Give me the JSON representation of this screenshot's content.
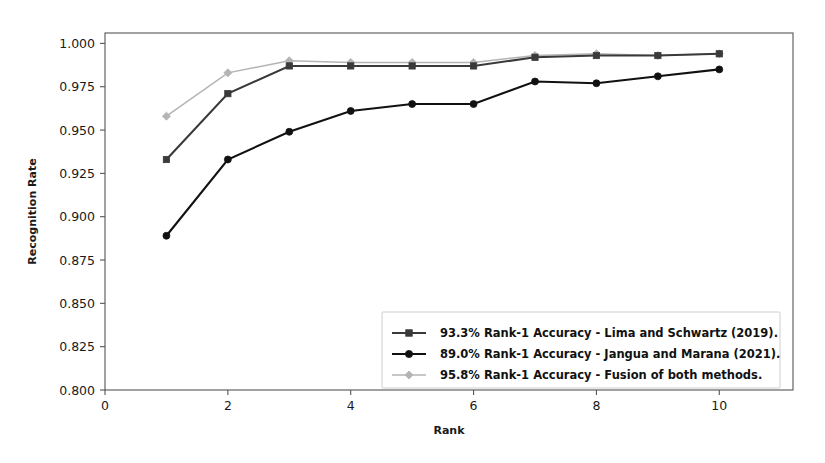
{
  "chart_data": {
    "type": "line",
    "title": "",
    "xlabel": "Rank",
    "ylabel": "Recognition Rate",
    "xlim": [
      0,
      11.2
    ],
    "ylim": [
      0.8,
      1.006
    ],
    "xticks": [
      0,
      2,
      4,
      6,
      8,
      10
    ],
    "xticklabels": [
      "0",
      "2",
      "4",
      "6",
      "8",
      "10"
    ],
    "yticks": [
      0.8,
      0.825,
      0.85,
      0.875,
      0.9,
      0.925,
      0.95,
      0.975,
      1.0
    ],
    "yticklabels": [
      "0.800",
      "0.825",
      "0.850",
      "0.875",
      "0.900",
      "0.925",
      "0.950",
      "0.975",
      "1.000"
    ],
    "grid": false,
    "legend_position": "lower right",
    "x": [
      1,
      2,
      3,
      4,
      5,
      6,
      7,
      8,
      9,
      10
    ],
    "series": [
      {
        "name": "93.3% Rank-1 Accuracy - Lima and Schwartz (2019).",
        "marker": "square",
        "color": "#3a3a3a",
        "values": [
          0.933,
          0.971,
          0.987,
          0.987,
          0.987,
          0.987,
          0.992,
          0.993,
          0.993,
          0.994
        ]
      },
      {
        "name": "89.0% Rank-1 Accuracy - Jangua and Marana (2021).",
        "marker": "circle",
        "color": "#111111",
        "values": [
          0.889,
          0.933,
          0.949,
          0.961,
          0.965,
          0.965,
          0.978,
          0.977,
          0.981,
          0.985
        ]
      },
      {
        "name": "95.8% Rank-1 Accuracy - Fusion of both methods.",
        "marker": "diamond",
        "color": "#b4b4b4",
        "values": [
          0.958,
          0.983,
          0.99,
          0.989,
          0.989,
          0.989,
          0.993,
          0.994,
          0.993,
          0.994
        ]
      }
    ]
  }
}
